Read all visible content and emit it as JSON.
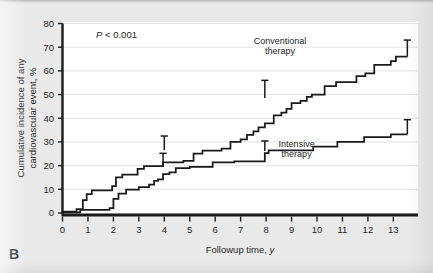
{
  "figure": {
    "panel_label": "B",
    "background_color": "#e9e9e9",
    "plot_background_color": "#ffffff",
    "line_color": "#1a1a1a"
  },
  "annotations": {
    "p_value_symbol": "P",
    "p_value_text": " < 0.001"
  },
  "chart_data": {
    "type": "line",
    "subtype": "step",
    "title": "",
    "xlabel_text": "Followup time, ",
    "xlabel_italic": "y",
    "ylabel_line1": "Cumulative incidence of any",
    "ylabel_line2": "cardiovascular event, %",
    "xlim": [
      0,
      13.6
    ],
    "ylim": [
      0,
      80
    ],
    "xticks": [
      0,
      1,
      2,
      3,
      4,
      5,
      6,
      7,
      8,
      9,
      10,
      11,
      12,
      13
    ],
    "xtick_labels": [
      "0",
      "1",
      "2",
      "3",
      "4",
      "5",
      "6",
      "7",
      "8",
      "9",
      "10",
      "11",
      "12",
      "13"
    ],
    "yticks": [
      0,
      10,
      20,
      30,
      40,
      50,
      60,
      70,
      80
    ],
    "ytick_labels": [
      "0",
      "10",
      "20",
      "30",
      "40",
      "50",
      "60",
      "70",
      "80"
    ],
    "grid": "horizontal",
    "legend": "inline-labels",
    "annotation": "P < 0.001",
    "series": [
      {
        "name": "Conventional therapy",
        "label_line1": "Conventional",
        "label_line2": "therapy",
        "label_x": 8.55,
        "label_y": 71.5,
        "steps": [
          [
            0.0,
            0.6
          ],
          [
            0.55,
            0.6
          ],
          [
            0.55,
            1.6
          ],
          [
            0.8,
            1.6
          ],
          [
            0.8,
            5.4
          ],
          [
            0.95,
            5.4
          ],
          [
            0.95,
            8.0
          ],
          [
            1.15,
            8.0
          ],
          [
            1.15,
            9.6
          ],
          [
            1.95,
            9.6
          ],
          [
            1.95,
            11.3
          ],
          [
            2.1,
            11.3
          ],
          [
            2.1,
            15.0
          ],
          [
            2.35,
            15.0
          ],
          [
            2.35,
            16.2
          ],
          [
            2.95,
            16.2
          ],
          [
            2.95,
            18.6
          ],
          [
            3.2,
            18.6
          ],
          [
            3.2,
            19.8
          ],
          [
            3.95,
            19.8
          ],
          [
            3.95,
            21.4
          ],
          [
            4.75,
            21.4
          ],
          [
            4.75,
            22.0
          ],
          [
            5.15,
            22.0
          ],
          [
            5.15,
            25.1
          ],
          [
            5.5,
            25.1
          ],
          [
            5.5,
            26.3
          ],
          [
            6.25,
            26.3
          ],
          [
            6.25,
            27.2
          ],
          [
            6.6,
            27.2
          ],
          [
            6.6,
            30.0
          ],
          [
            7.0,
            30.0
          ],
          [
            7.0,
            31.1
          ],
          [
            7.25,
            31.1
          ],
          [
            7.25,
            33.0
          ],
          [
            7.5,
            33.0
          ],
          [
            7.5,
            34.5
          ],
          [
            7.7,
            34.5
          ],
          [
            7.7,
            36.2
          ],
          [
            7.95,
            36.2
          ],
          [
            7.95,
            37.8
          ],
          [
            8.3,
            37.8
          ],
          [
            8.3,
            41.2
          ],
          [
            8.6,
            41.2
          ],
          [
            8.6,
            42.4
          ],
          [
            8.8,
            42.4
          ],
          [
            8.8,
            44.0
          ],
          [
            9.0,
            44.0
          ],
          [
            9.0,
            46.4
          ],
          [
            9.35,
            46.4
          ],
          [
            9.35,
            47.3
          ],
          [
            9.6,
            47.3
          ],
          [
            9.6,
            49.0
          ],
          [
            9.8,
            49.0
          ],
          [
            9.8,
            50.0
          ],
          [
            10.3,
            50.0
          ],
          [
            10.3,
            53.6
          ],
          [
            10.75,
            53.6
          ],
          [
            10.75,
            55.3
          ],
          [
            11.55,
            55.3
          ],
          [
            11.55,
            57.8
          ],
          [
            11.9,
            57.8
          ],
          [
            11.9,
            58.9
          ],
          [
            12.25,
            58.9
          ],
          [
            12.25,
            62.5
          ],
          [
            12.9,
            62.5
          ],
          [
            12.9,
            64.1
          ],
          [
            13.1,
            64.1
          ],
          [
            13.1,
            66.0
          ],
          [
            13.55,
            66.0
          ]
        ],
        "error_bars": [
          {
            "x": 4.0,
            "y": 26.5,
            "lower": 0.0,
            "upper": 6.0
          },
          {
            "x": 7.95,
            "y": 48.5,
            "lower": 0.0,
            "upper": 7.5
          },
          {
            "x": 13.55,
            "y": 66.0,
            "lower": 0.0,
            "upper": 7.0
          }
        ]
      },
      {
        "name": "Intensive therapy",
        "label_line1": "Intensive",
        "label_line2": "therapy",
        "label_x": 9.2,
        "label_y": 28.0,
        "steps": [
          [
            0.0,
            0.3
          ],
          [
            0.7,
            0.3
          ],
          [
            0.7,
            1.3
          ],
          [
            1.85,
            1.3
          ],
          [
            1.85,
            2.1
          ],
          [
            2.0,
            2.1
          ],
          [
            2.0,
            6.0
          ],
          [
            2.2,
            6.0
          ],
          [
            2.2,
            8.2
          ],
          [
            2.5,
            8.2
          ],
          [
            2.5,
            9.9
          ],
          [
            3.0,
            9.9
          ],
          [
            3.0,
            10.9
          ],
          [
            3.4,
            10.9
          ],
          [
            3.4,
            12.0
          ],
          [
            3.6,
            12.0
          ],
          [
            3.6,
            13.6
          ],
          [
            3.75,
            13.6
          ],
          [
            3.75,
            14.2
          ],
          [
            3.95,
            14.2
          ],
          [
            3.95,
            16.4
          ],
          [
            4.2,
            16.4
          ],
          [
            4.2,
            17.2
          ],
          [
            4.45,
            17.2
          ],
          [
            4.45,
            18.9
          ],
          [
            5.0,
            18.9
          ],
          [
            5.0,
            19.5
          ],
          [
            5.9,
            19.5
          ],
          [
            5.9,
            21.4
          ],
          [
            6.75,
            21.4
          ],
          [
            6.75,
            21.8
          ],
          [
            7.95,
            21.8
          ],
          [
            7.95,
            25.3
          ],
          [
            8.1,
            25.3
          ],
          [
            8.1,
            26.4
          ],
          [
            9.85,
            26.4
          ],
          [
            9.85,
            28.0
          ],
          [
            10.8,
            28.0
          ],
          [
            10.8,
            30.0
          ],
          [
            11.85,
            30.0
          ],
          [
            11.85,
            32.0
          ],
          [
            12.9,
            32.0
          ],
          [
            12.9,
            33.2
          ],
          [
            13.55,
            33.2
          ]
        ],
        "error_bars": [
          {
            "x": 3.95,
            "y": 19.5,
            "lower": 0.0,
            "upper": 5.7
          },
          {
            "x": 7.95,
            "y": 26.2,
            "lower": 0.0,
            "upper": 4.2
          },
          {
            "x": 13.55,
            "y": 33.2,
            "lower": 0.0,
            "upper": 6.2
          }
        ]
      }
    ]
  }
}
